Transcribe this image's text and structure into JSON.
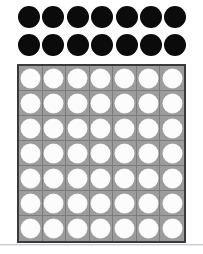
{
  "canvas": {
    "width": 203,
    "height": 254,
    "background_color": "#ffffff"
  },
  "counters": {
    "label": "black counters",
    "color": "#0b0b0b",
    "shape": "circle",
    "rows": [
      {
        "row_index": 1,
        "count": 7,
        "items": [
          "counter",
          "counter",
          "counter",
          "counter",
          "counter",
          "counter",
          "counter"
        ]
      },
      {
        "row_index": 2,
        "count": 7,
        "items": [
          "counter",
          "counter",
          "counter",
          "counter",
          "counter",
          "counter",
          "counter"
        ]
      }
    ],
    "total": 14
  },
  "grid": {
    "label": "seven by seven array",
    "columns": 7,
    "rows": 7,
    "total_cells": 49,
    "cell_fill_color": "#9c9c9c",
    "gridline_color": "#7c7c7c",
    "border_color": "#3a3a3a",
    "token_color": "#fcfcfc",
    "token_shape": "circle",
    "cells": [
      [
        "token",
        "token",
        "token",
        "token",
        "token",
        "token",
        "token"
      ],
      [
        "token",
        "token",
        "token",
        "token",
        "token",
        "token",
        "token"
      ],
      [
        "token",
        "token",
        "token",
        "token",
        "token",
        "token",
        "token"
      ],
      [
        "token",
        "token",
        "token",
        "token",
        "token",
        "token",
        "token"
      ],
      [
        "token",
        "token",
        "token",
        "token",
        "token",
        "token",
        "token"
      ],
      [
        "token",
        "token",
        "token",
        "token",
        "token",
        "token",
        "token"
      ],
      [
        "token",
        "token",
        "token",
        "token",
        "token",
        "token",
        "token"
      ]
    ]
  },
  "separator": {
    "label": "bottom rule",
    "color": "#c9ccd1"
  },
  "chart_data": {
    "type": "table",
    "title": "",
    "xlabel": "",
    "ylabel": "",
    "series": [
      {
        "name": "black counters",
        "rows": 2,
        "columns": 7,
        "values": [
          7,
          7
        ],
        "total": 14
      },
      {
        "name": "white counters in grid",
        "rows": 7,
        "columns": 7,
        "values": [
          7,
          7,
          7,
          7,
          7,
          7,
          7
        ],
        "total": 49
      }
    ]
  }
}
